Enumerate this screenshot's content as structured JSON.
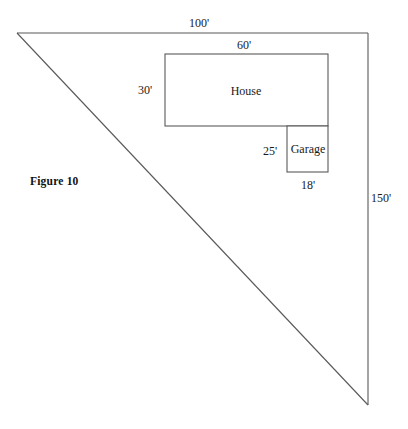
{
  "figure": {
    "caption": "Figure 10",
    "type": "site-plan-diagram",
    "stroke_color": "#595959",
    "text_color": "#1a1a1a",
    "background_color": "#ffffff"
  },
  "lot": {
    "shape": "right-triangle",
    "name": "triangular-lot",
    "apex": {
      "x": 17,
      "y": 33
    },
    "top_right": {
      "x": 368,
      "y": 33
    },
    "bottom_right": {
      "x": 368,
      "y": 405
    },
    "labels": {
      "top_side": "100'",
      "right_side": "150'"
    }
  },
  "house": {
    "label": "House",
    "width_label": "60'",
    "height_label": "30'",
    "rect": {
      "x": 165,
      "y": 54,
      "w": 163,
      "h": 72
    }
  },
  "garage": {
    "label": "Garage",
    "width_label": "18'",
    "height_label": "25'",
    "rect": {
      "x": 287,
      "y": 126,
      "w": 41,
      "h": 46
    }
  }
}
